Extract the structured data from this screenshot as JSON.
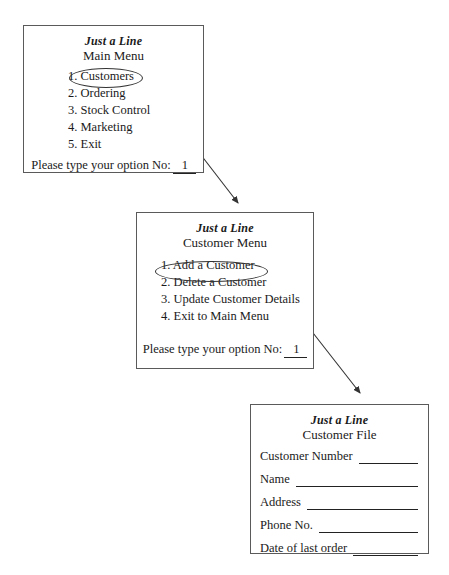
{
  "diagram": {
    "brand": "Just a Line",
    "line_color": "#333333",
    "box_border_color": "#5a5a5a",
    "background": "#ffffff"
  },
  "main_menu": {
    "brand": "Just a Line",
    "title": "Main Menu",
    "items": [
      {
        "number": "1.",
        "label": "Customers"
      },
      {
        "number": "2.",
        "label": "Ordering"
      },
      {
        "number": "3.",
        "label": "Stock Control"
      },
      {
        "number": "4.",
        "label": "Marketing"
      },
      {
        "number": "5.",
        "label": "Exit"
      }
    ],
    "prompt": "Please type your option No:",
    "typed_option": "1",
    "highlighted_item": "Customers"
  },
  "customer_menu": {
    "brand": "Just a Line",
    "title": "Customer Menu",
    "items": [
      {
        "number": "1.",
        "label": "Add a Customer"
      },
      {
        "number": "2.",
        "label": "Delete a Customer"
      },
      {
        "number": "3.",
        "label": "Update Customer Details"
      },
      {
        "number": "4.",
        "label": "Exit to Main Menu"
      }
    ],
    "prompt": "Please type your option No:",
    "typed_option": "1",
    "highlighted_item": "1. Add a Customer"
  },
  "customer_file": {
    "brand": "Just a Line",
    "title": "Customer File",
    "fields": [
      {
        "label": "Customer Number",
        "value": ""
      },
      {
        "label": "Name",
        "value": ""
      },
      {
        "label": "Address",
        "value": ""
      },
      {
        "label": "Phone No.",
        "value": ""
      },
      {
        "label": "Date of last order",
        "value": ""
      }
    ]
  },
  "connectors": [
    {
      "name": "main-menu-to-customer-menu",
      "from": "Customers",
      "to": "Customer Menu"
    },
    {
      "name": "customer-menu-to-customer-file",
      "from": "1. Add a Customer",
      "to": "Customer File"
    }
  ]
}
